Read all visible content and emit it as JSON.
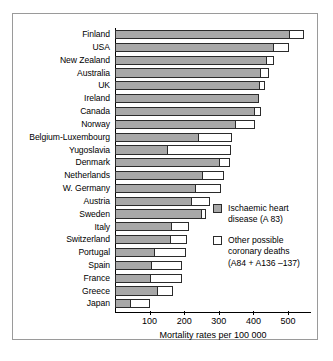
{
  "chart_data": {
    "type": "bar",
    "orientation": "horizontal",
    "stacked": true,
    "title": "",
    "xlabel": "Mortality rates per 100 000",
    "ylabel": "",
    "xlim": [
      0,
      560
    ],
    "xticks": [
      100,
      200,
      300,
      400,
      500
    ],
    "xtick_labels": [
      "100",
      "200",
      "300",
      "400",
      "500"
    ],
    "grid": false,
    "legend_position": "center-right",
    "categories": [
      "Finland",
      "USA",
      "New Zealand",
      "Australia",
      "UK",
      "Ireland",
      "Canada",
      "Norway",
      "Belgium-Luxembourg",
      "Yugoslavia",
      "Denmark",
      "Netherlands",
      "W. Germany",
      "Austria",
      "Sweden",
      "Italy",
      "Switzerland",
      "Portugal",
      "Spain",
      "France",
      "Greece",
      "Japan"
    ],
    "series": [
      {
        "name": "Ischaemic heart disease (A 83)",
        "color": "#a8a8a8",
        "values": [
          506,
          460,
          438,
          423,
          418,
          416,
          404,
          350,
          243,
          154,
          303,
          255,
          235,
          222,
          250,
          166,
          163,
          117,
          108,
          105,
          125,
          47
        ]
      },
      {
        "name": "Other possible coronary deaths (A84 + A136 –137)",
        "color": "#ffffff",
        "values": [
          39,
          44,
          22,
          22,
          16,
          0,
          18,
          55,
          95,
          180,
          28,
          60,
          70,
          52,
          13,
          49,
          46,
          89,
          87,
          90,
          44,
          53
        ]
      }
    ],
    "totals": [
      545,
      504,
      460,
      445,
      434,
      416,
      422,
      405,
      338,
      334,
      331,
      315,
      305,
      274,
      263,
      215,
      209,
      206,
      195,
      195,
      169,
      100
    ]
  },
  "legend": {
    "items": [
      {
        "swatch": "grey",
        "label": "Ischaemic heart\ndisease (A 83)"
      },
      {
        "swatch": "white",
        "label": "Other possible\ncoronary deaths\n(A84 + A136 –137)"
      }
    ]
  },
  "axis": {
    "x_title": "Mortality rates per 100 000",
    "tick_labels": [
      "100",
      "200",
      "300",
      "400",
      "500"
    ]
  }
}
